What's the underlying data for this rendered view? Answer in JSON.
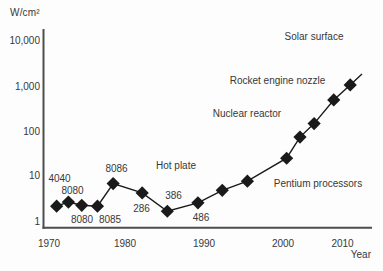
{
  "chart_data": {
    "type": "line",
    "title": "",
    "unit_label": "W/cm²",
    "xlabel": "Year",
    "y_scale": "log",
    "x_ticks": [
      "1970",
      "1980",
      "1990",
      "2000",
      "2010"
    ],
    "y_ticks": [
      "10,000",
      "1,000",
      "100",
      "10",
      "1"
    ],
    "x_range": [
      1970,
      2012
    ],
    "y_range": [
      1,
      10000
    ],
    "grid": false,
    "legend": "none",
    "series": [
      {
        "name": "Processor power density",
        "marker": "filled-diamond",
        "points": [
          {
            "year": 1971.1,
            "w_per_cm2": 2.2,
            "chip": "4040"
          },
          {
            "year": 1972.6,
            "w_per_cm2": 2.7,
            "chip": "8080"
          },
          {
            "year": 1974.3,
            "w_per_cm2": 2.3,
            "chip": "8080"
          },
          {
            "year": 1976.3,
            "w_per_cm2": 2.2,
            "chip": "8085"
          },
          {
            "year": 1978.3,
            "w_per_cm2": 6.9,
            "chip": "8086"
          },
          {
            "year": 1982.0,
            "w_per_cm2": 4.3,
            "chip": "286"
          },
          {
            "year": 1985.2,
            "w_per_cm2": 1.7,
            "chip": "386"
          },
          {
            "year": 1989.1,
            "w_per_cm2": 2.6,
            "chip": "486"
          },
          {
            "year": 1992.2,
            "w_per_cm2": 4.9,
            "chip": ""
          },
          {
            "year": 1995.4,
            "w_per_cm2": 7.8,
            "chip": ""
          },
          {
            "year": 2000.4,
            "w_per_cm2": 25,
            "chip": ""
          },
          {
            "year": 2002.1,
            "w_per_cm2": 73,
            "chip": ""
          },
          {
            "year": 2003.9,
            "w_per_cm2": 145,
            "chip": ""
          },
          {
            "year": 2006.4,
            "w_per_cm2": 480,
            "chip": ""
          },
          {
            "year": 2008.5,
            "w_per_cm2": 1030,
            "chip": ""
          }
        ]
      }
    ],
    "chip_labels": [
      {
        "text": "4040",
        "px": [
          59.5,
          178
        ]
      },
      {
        "text": "8080",
        "px": [
          72.5,
          190.5
        ]
      },
      {
        "text": "8086",
        "px": [
          116.5,
          168.5
        ]
      },
      {
        "text": "8080",
        "px": [
          82,
          219
        ]
      },
      {
        "text": "8085",
        "px": [
          110,
          219
        ]
      },
      {
        "text": "286",
        "px": [
          141.5,
          208
        ]
      },
      {
        "text": "386",
        "px": [
          173.5,
          195.5
        ]
      },
      {
        "text": "486",
        "px": [
          201,
          217
        ]
      }
    ],
    "annotations": [
      {
        "text": "Solar surface",
        "px": [
          314,
          36
        ]
      },
      {
        "text": "Rocket engine nozzle",
        "px": [
          277.5,
          80
        ]
      },
      {
        "text": "Nuclear reactor",
        "px": [
          247,
          113.5
        ]
      },
      {
        "text": "Hot plate",
        "px": [
          176,
          165
        ]
      },
      {
        "text": "Pentium processors",
        "px": [
          318,
          183.5
        ]
      }
    ],
    "colors": {
      "line": "#1a1a1a",
      "marker": "#1a1a1a",
      "axis": "#4d4d4d",
      "text": "#383838",
      "background": "#fdfdfd"
    }
  }
}
